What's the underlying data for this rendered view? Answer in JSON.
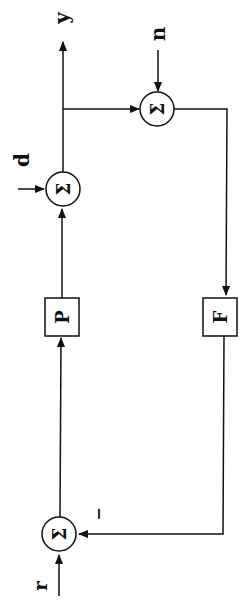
{
  "diagram": {
    "type": "feedback-block-diagram",
    "orientation": "rotated-90",
    "blocks": [
      {
        "id": "P",
        "label": "P"
      },
      {
        "id": "F",
        "label": "F"
      }
    ],
    "summing_junctions": [
      {
        "id": "sum_ref",
        "symbol": "Σ"
      },
      {
        "id": "sum_d",
        "symbol": "Σ"
      },
      {
        "id": "sum_n",
        "symbol": "Σ"
      }
    ],
    "signals": {
      "reference": "r",
      "disturbance": "d",
      "noise": "n",
      "output": "y",
      "feedback_sign": "−"
    }
  }
}
